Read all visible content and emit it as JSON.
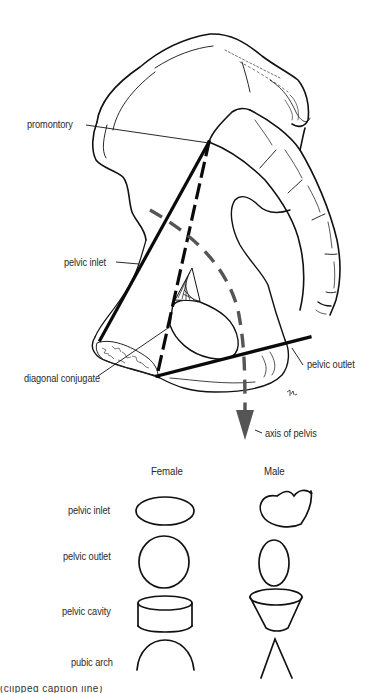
{
  "figure": {
    "labels": {
      "promontory": "promontory",
      "pelvic_inlet": "pelvic inlet",
      "diagonal_conjugate": "diagonal conjugate",
      "pelvic_outlet": "pelvic outlet",
      "axis_of_pelvis": "axis of pelvis",
      "signature": "td."
    },
    "colors": {
      "line": "#111111",
      "axis": "#555555",
      "text": "#2a2a2a"
    }
  },
  "comparison": {
    "columns": [
      "Female",
      "Male"
    ],
    "rows": [
      {
        "label": "pelvic inlet",
        "female_shape": "wide oval",
        "male_shape": "heart"
      },
      {
        "label": "pelvic outlet",
        "female_shape": "circle",
        "male_shape": "narrow oval"
      },
      {
        "label": "pelvic cavity",
        "female_shape": "short cylinder",
        "male_shape": "funnel"
      },
      {
        "label": "pubic arch",
        "female_shape": "round arch",
        "male_shape": "narrow angle"
      }
    ]
  },
  "caption": {
    "text": "(clipped caption line)"
  }
}
